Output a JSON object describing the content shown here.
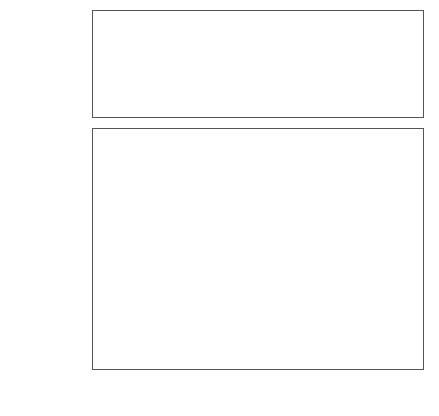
{
  "chart_data": [
    {
      "id": "existing-members",
      "type": "bar",
      "orientation": "horizontal",
      "title": "",
      "xlabel": "",
      "ylabel": "",
      "categories": [
        "Ireland (1973)",
        "Greece (1981)",
        "Spain (1986)",
        "Portugal (1986)"
      ],
      "values": [
        59.3,
        58.1,
        70.6,
        51.1
      ],
      "series": [
        {
          "name": "GDP per capita at accession",
          "values": [
            59.3,
            58.1,
            70.6,
            51.1
          ],
          "color": "#c6c6c6"
        }
      ],
      "xlim": [
        0,
        80
      ],
      "xticks": [
        0,
        10,
        20,
        30,
        40,
        50,
        60,
        70,
        80
      ],
      "xticklabels": [
        "",
        "",
        "",
        "",
        "",
        "",
        "",
        "",
        ""
      ],
      "grid": false,
      "legend": false
    },
    {
      "id": "candidate-countries",
      "type": "bar",
      "orientation": "horizontal",
      "title": "",
      "xlabel": "GDP per capita as percentage of the EU average",
      "ylabel": "",
      "categories": [
        "Bulgaria",
        "Czech Republic",
        "Estonia",
        "Hungary",
        "Latvia",
        "Lithuania",
        "Poland",
        "Romania",
        "Slovak Republic",
        "Slovenia"
      ],
      "series": [
        {
          "name": "1991",
          "color": "#c6c6c6",
          "values": [
            32.5,
            60.0,
            43.4,
            49.3,
            46.6,
            46.1,
            29.7,
            31.9,
            45.1,
            64.0
          ]
        },
        {
          "name": "1996",
          "color": "#7d7d7d",
          "values": [
            32.5,
            64.8,
            34.4,
            47.4,
            28.7,
            28.7,
            34.8,
            33.6,
            44.6,
            67.1
          ]
        },
        {
          "name": "2001",
          "color": "#2b2b2b",
          "values": [
            25.5,
            61.2,
            42.4,
            53.1,
            31.4,
            31.2,
            37.9,
            28.1,
            47.5,
            73.8
          ]
        }
      ],
      "xlim": [
        0,
        80
      ],
      "xticks": [
        0,
        10,
        20,
        30,
        40,
        50,
        60,
        70,
        80
      ],
      "xticklabels": [
        "0",
        "10",
        "20",
        "30",
        "40",
        "50",
        "60",
        "70",
        "80"
      ],
      "grid": false,
      "legend": true,
      "legend_position": "right-inside"
    }
  ],
  "legend": {
    "entries": [
      {
        "label": "1991",
        "color": "#c6c6c6"
      },
      {
        "label": "1996",
        "color": "#7d7d7d"
      },
      {
        "label": "2001",
        "color": "#2b2b2b"
      }
    ]
  },
  "axis": {
    "title": "GDP per capita as percentage of the EU average",
    "ticklabels": [
      "0",
      "10",
      "20",
      "30",
      "40",
      "50",
      "60",
      "70",
      "80"
    ]
  },
  "colors": {
    "series_1991": "#c6c6c6",
    "series_1996": "#7d7d7d",
    "series_2001": "#2b2b2b",
    "frame": "#555555",
    "bar_outline": "#4a4a4a",
    "text": "#1a1a1a",
    "background": "#ffffff"
  }
}
